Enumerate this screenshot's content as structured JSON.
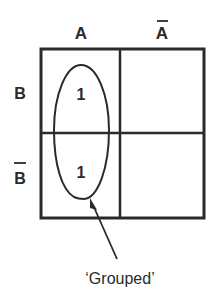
{
  "diagram": {
    "type": "karnaugh-map",
    "column_headers": [
      "A",
      "Ā"
    ],
    "row_headers": [
      "B",
      "B̄"
    ],
    "cells": [
      [
        "1",
        ""
      ],
      [
        "1",
        ""
      ]
    ],
    "group_annotation": "'Grouped'"
  },
  "labels": {
    "col_a": "A",
    "col_a_bar": "A",
    "row_b": "B",
    "row_b_bar": "B",
    "cell_00": "1",
    "cell_10": "1",
    "annotation": "‘Grouped’"
  },
  "colors": {
    "ink": "#2a2a2a",
    "background": "#ffffff"
  }
}
